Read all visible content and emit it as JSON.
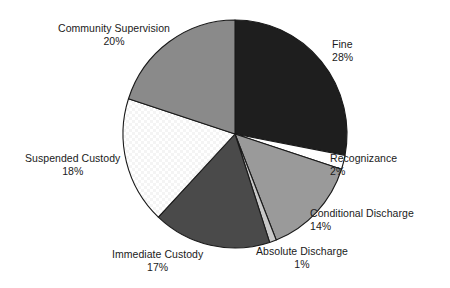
{
  "chart_data": {
    "type": "pie",
    "title": "",
    "subtitle": "",
    "xlabel": "",
    "ylabel": "",
    "grid": false,
    "legend_position": "none",
    "label_format": "name + percent",
    "start_angle_deg": 0,
    "direction": "clockwise",
    "categories": [
      "Fine",
      "Recognizance",
      "Conditional Discharge",
      "Absolute Discharge",
      "Immediate Custody",
      "Suspended Custody",
      "Community Supervision"
    ],
    "values": [
      28,
      2,
      14,
      1,
      17,
      18,
      20
    ],
    "unit": "%",
    "slices": [
      {
        "key": "fine",
        "label": "Fine",
        "value": 28,
        "value_text": "28%",
        "color": "#1e1e1e",
        "pattern": "solid"
      },
      {
        "key": "recognizance",
        "label": "Recognizance",
        "value": 2,
        "value_text": "2%",
        "color": "#ffffff",
        "pattern": "solid"
      },
      {
        "key": "conditional-discharge",
        "label": "Conditional Discharge",
        "value": 14,
        "value_text": "14%",
        "color": "#9a9a9a",
        "pattern": "solid"
      },
      {
        "key": "absolute-discharge",
        "label": "Absolute Discharge",
        "value": 1,
        "value_text": "1%",
        "color": "#c8c8c8",
        "pattern": "solid"
      },
      {
        "key": "immediate-custody",
        "label": "Immediate Custody",
        "value": 17,
        "value_text": "17%",
        "color": "#4a4a4a",
        "pattern": "solid"
      },
      {
        "key": "suspended-custody",
        "label": "Suspended Custody",
        "value": 18,
        "value_text": "18%",
        "color": "#ffffff",
        "pattern": "checker"
      },
      {
        "key": "community-supervision",
        "label": "Community Supervision",
        "value": 20,
        "value_text": "20%",
        "color": "#8a8a8a",
        "pattern": "solid"
      }
    ],
    "colors": {
      "outline": "#1a1a1a",
      "background": "#ffffff",
      "text": "#1a1a1a"
    }
  }
}
